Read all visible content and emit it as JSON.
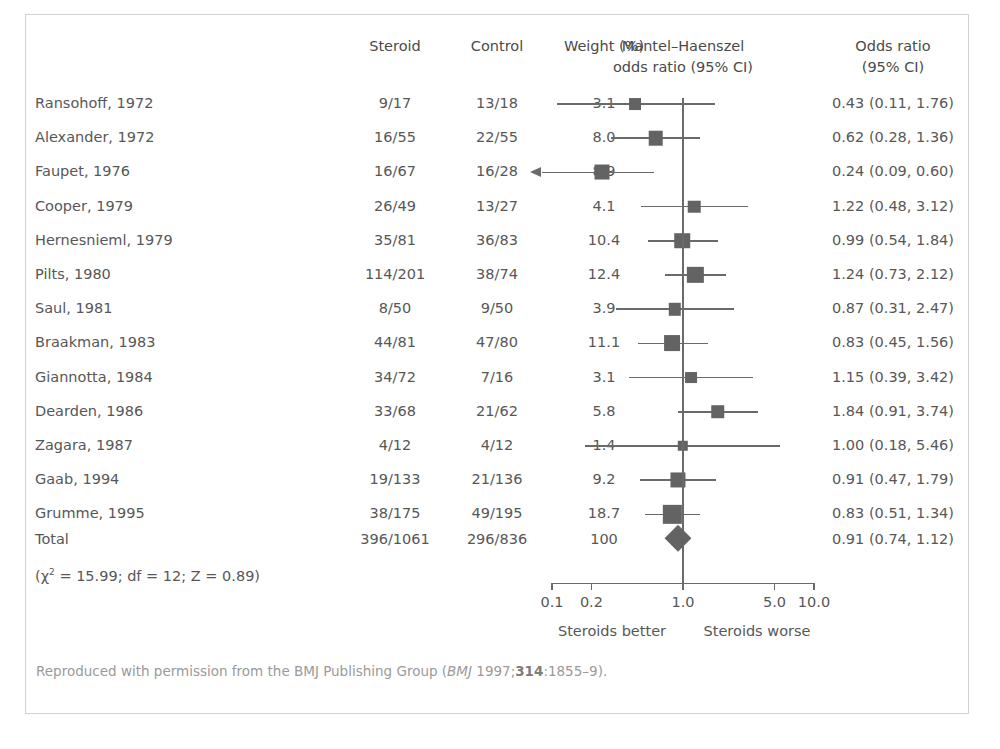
{
  "figure": {
    "cut_off_caption": "",
    "footer_prefix": "Reproduced with permission from the BMJ Publishing Group (",
    "footer_journal": "BMJ",
    "footer_mid": " 1997;",
    "footer_volume": "314",
    "footer_suffix": ":1855–9).",
    "chi_square_line_prefix": "(χ",
    "chi_square_line_sup": "2",
    "chi_square_line_rest": " = 15.99; df = 12; Z = 0.89)"
  },
  "headers": {
    "study": "",
    "steroid": "Steroid",
    "control": "Control",
    "weight": "Weight (%)",
    "plot_line1": "Mantel–Haenszel",
    "plot_line2": "odds ratio (95% CI)",
    "or_line1": "Odds ratio",
    "or_line2": "(95% CI)"
  },
  "axis": {
    "ticks": [
      "0.1",
      "0.2",
      "1.0",
      "5.0",
      "10.0"
    ],
    "tick_values": [
      0.1,
      0.2,
      1.0,
      5.0,
      10.0
    ],
    "left_caption": "Steroids better",
    "right_caption": "Steroids worse",
    "null_value": 1.0
  },
  "total": {
    "label": "Total",
    "steroid": "396/1061",
    "control": "296/836",
    "weight": "100",
    "or_text": "0.91 (0.74, 1.12)",
    "or": 0.91,
    "lcl": 0.74,
    "ucl": 1.12
  },
  "colors": {
    "text": "#575757",
    "marker": "#636363",
    "line": "#6a6a6a",
    "border": "#d2d2d2",
    "footer": "#9a9a9a"
  },
  "chart_data": {
    "type": "forest",
    "xlabel": "Odds ratio",
    "xscale": "log",
    "xlim": [
      0.1,
      10.0
    ],
    "xticks": [
      0.1,
      0.2,
      1.0,
      5.0,
      10.0
    ],
    "xticklabels": [
      "0.1",
      "0.2",
      "1.0",
      "5.0",
      "10.0"
    ],
    "null_line": 1.0,
    "grid": false,
    "legend": "none",
    "columns": [
      "Study",
      "Steroid",
      "Control",
      "Weight (%)",
      "Odds ratio (95% CI)"
    ],
    "rows": [
      {
        "study": "Ransohoff, 1972",
        "steroid": "9/17",
        "control": "13/18",
        "weight": 3.1,
        "weight_text": "3.1",
        "or": 0.43,
        "lcl": 0.11,
        "ucl": 1.76,
        "or_text": "0.43 (0.11, 1.76)",
        "clipped_left": false
      },
      {
        "study": "Alexander, 1972",
        "steroid": "16/55",
        "control": "22/55",
        "weight": 8.0,
        "weight_text": "8.0",
        "or": 0.62,
        "lcl": 0.28,
        "ucl": 1.36,
        "or_text": "0.62 (0.28, 1.36)",
        "clipped_left": false
      },
      {
        "study": "Faupet, 1976",
        "steroid": "16/67",
        "control": "16/28",
        "weight": 8.9,
        "weight_text": "8.9",
        "or": 0.24,
        "lcl": 0.09,
        "ucl": 0.6,
        "or_text": "0.24 (0.09, 0.60)",
        "clipped_left": true
      },
      {
        "study": "Cooper, 1979",
        "steroid": "26/49",
        "control": "13/27",
        "weight": 4.1,
        "weight_text": "4.1",
        "or": 1.22,
        "lcl": 0.48,
        "ucl": 3.12,
        "or_text": "1.22 (0.48, 3.12)",
        "clipped_left": false
      },
      {
        "study": "Hernesnieml, 1979",
        "steroid": "35/81",
        "control": "36/83",
        "weight": 10.4,
        "weight_text": "10.4",
        "or": 0.99,
        "lcl": 0.54,
        "ucl": 1.84,
        "or_text": "0.99 (0.54, 1.84)",
        "clipped_left": false
      },
      {
        "study": "Pilts, 1980",
        "steroid": "114/201",
        "control": "38/74",
        "weight": 12.4,
        "weight_text": "12.4",
        "or": 1.24,
        "lcl": 0.73,
        "ucl": 2.12,
        "or_text": "1.24 (0.73, 2.12)",
        "clipped_left": false
      },
      {
        "study": "Saul, 1981",
        "steroid": "8/50",
        "control": "9/50",
        "weight": 3.9,
        "weight_text": "3.9",
        "or": 0.87,
        "lcl": 0.31,
        "ucl": 2.47,
        "or_text": "0.87 (0.31, 2.47)",
        "clipped_left": false
      },
      {
        "study": "Braakman, 1983",
        "steroid": "44/81",
        "control": "47/80",
        "weight": 11.1,
        "weight_text": "11.1",
        "or": 0.83,
        "lcl": 0.45,
        "ucl": 1.56,
        "or_text": "0.83 (0.45, 1.56)",
        "clipped_left": false
      },
      {
        "study": "Giannotta, 1984",
        "steroid": "34/72",
        "control": "7/16",
        "weight": 3.1,
        "weight_text": "3.1",
        "or": 1.15,
        "lcl": 0.39,
        "ucl": 3.42,
        "or_text": "1.15 (0.39, 3.42)",
        "clipped_left": false
      },
      {
        "study": "Dearden, 1986",
        "steroid": "33/68",
        "control": "21/62",
        "weight": 5.8,
        "weight_text": "5.8",
        "or": 1.84,
        "lcl": 0.91,
        "ucl": 3.74,
        "or_text": "1.84 (0.91, 3.74)",
        "clipped_left": false
      },
      {
        "study": "Zagara, 1987",
        "steroid": "4/12",
        "control": "4/12",
        "weight": 1.4,
        "weight_text": "1.4",
        "or": 1.0,
        "lcl": 0.18,
        "ucl": 5.46,
        "or_text": "1.00 (0.18, 5.46)",
        "clipped_left": false
      },
      {
        "study": "Gaab, 1994",
        "steroid": "19/133",
        "control": "21/136",
        "weight": 9.2,
        "weight_text": "9.2",
        "or": 0.91,
        "lcl": 0.47,
        "ucl": 1.79,
        "or_text": "0.91 (0.47, 1.79)",
        "clipped_left": false
      },
      {
        "study": "Grumme, 1995",
        "steroid": "38/175",
        "control": "49/195",
        "weight": 18.7,
        "weight_text": "18.7",
        "or": 0.83,
        "lcl": 0.51,
        "ucl": 1.34,
        "or_text": "0.83 (0.51, 1.34)",
        "clipped_left": false
      }
    ],
    "summary": {
      "label": "Total",
      "steroid": "396/1061",
      "control": "296/836",
      "weight": 100,
      "weight_text": "100",
      "or": 0.91,
      "lcl": 0.74,
      "ucl": 1.12,
      "or_text": "0.91 (0.74, 1.12)"
    },
    "heterogeneity": {
      "chi_square": 15.99,
      "df": 12,
      "z": 0.89
    }
  }
}
